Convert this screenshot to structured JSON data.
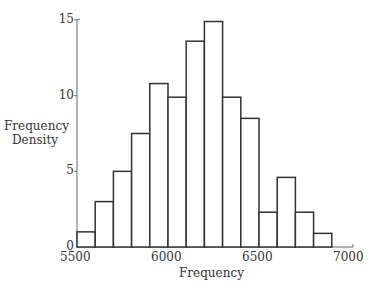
{
  "chart_data": {
    "type": "bar",
    "subtype": "histogram",
    "title": "",
    "xlabel": "Frequency",
    "ylabel": "Frequency Density",
    "xlim": [
      5500,
      7000
    ],
    "ylim": [
      0,
      15
    ],
    "xticks": [
      5500,
      6000,
      6500,
      7000
    ],
    "yticks": [
      0,
      5,
      10,
      15
    ],
    "grid": false,
    "legend": null,
    "bin_width": 100,
    "bins": [
      {
        "start": 5500,
        "end": 5600,
        "value": 1
      },
      {
        "start": 5600,
        "end": 5700,
        "value": 3
      },
      {
        "start": 5700,
        "end": 5800,
        "value": 5
      },
      {
        "start": 5800,
        "end": 5900,
        "value": 7.5
      },
      {
        "start": 5900,
        "end": 6000,
        "value": 10.8
      },
      {
        "start": 6000,
        "end": 6100,
        "value": 9.9
      },
      {
        "start": 6100,
        "end": 6200,
        "value": 13.6
      },
      {
        "start": 6200,
        "end": 6300,
        "value": 14.9
      },
      {
        "start": 6300,
        "end": 6400,
        "value": 9.9
      },
      {
        "start": 6400,
        "end": 6500,
        "value": 8.5
      },
      {
        "start": 6500,
        "end": 6600,
        "value": 2.3
      },
      {
        "start": 6600,
        "end": 6700,
        "value": 4.6
      },
      {
        "start": 6700,
        "end": 6800,
        "value": 2.3
      },
      {
        "start": 6800,
        "end": 6900,
        "value": 0.9
      }
    ],
    "categories": [
      "5500-5600",
      "5600-5700",
      "5700-5800",
      "5800-5900",
      "5900-6000",
      "6000-6100",
      "6100-6200",
      "6200-6300",
      "6300-6400",
      "6400-6500",
      "6500-6600",
      "6600-6700",
      "6700-6800",
      "6800-6900"
    ],
    "values": [
      1,
      3,
      5,
      7.5,
      10.8,
      9.9,
      13.6,
      14.9,
      9.9,
      8.5,
      2.3,
      4.6,
      2.3,
      0.9
    ]
  },
  "labels": {
    "xlabel": "Frequency",
    "ylabel_line1": "Frequency",
    "ylabel_line2": "Density"
  }
}
